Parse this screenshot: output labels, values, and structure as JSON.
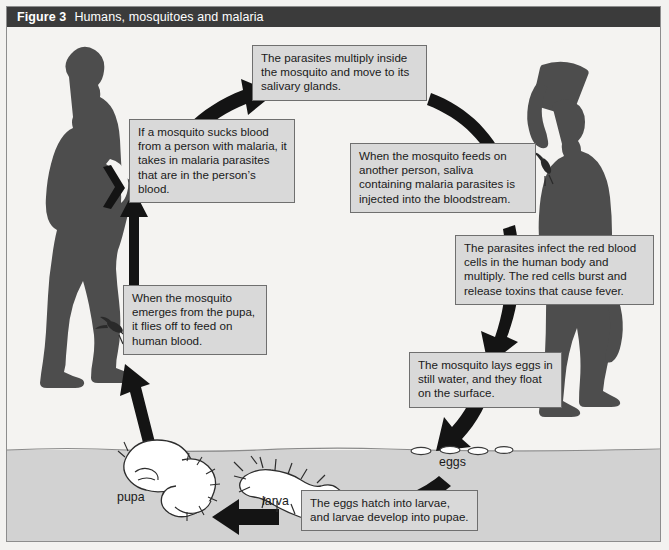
{
  "figure": {
    "number_label": "Figure 3",
    "title": "Humans, mosquitoes and malaria",
    "title_bar_bg": "#3b3b3b",
    "title_bar_fg": "#ffffff",
    "page_bg": "#f4f3f1",
    "silhouette_color": "#4d4d4d",
    "arrow_color": "#141414",
    "textbox_bg": "#d9d9d9",
    "textbox_border": "#6f6f6f",
    "water_fill": "#d2d2d2"
  },
  "callouts": [
    {
      "id": "parasites-multiply",
      "text": "The parasites multiply inside the mosquito and move to its salivary glands."
    },
    {
      "id": "mosquito-sucks-blood",
      "text": "If a mosquito sucks blood from a person with malaria, it takes in malaria parasites that are in the person’s blood."
    },
    {
      "id": "mosquito-feeds-another",
      "text": "When the mosquito feeds on another person, saliva containing malaria parasites is injected into the bloodstream."
    },
    {
      "id": "parasites-infect-red-cells",
      "text": "The parasites infect the red blood cells in the human body and multiply. The red cells burst and release toxins that cause fever."
    },
    {
      "id": "mosquito-lays-eggs",
      "text": "The mosquito lays eggs in still water, and they float on the surface."
    },
    {
      "id": "eggs-hatch",
      "text": "The eggs hatch into larvae, and larvae develop into pupae."
    },
    {
      "id": "mosquito-emerges",
      "text": "When the mosquito emerges from the pupa, it flies off to feed on human blood."
    }
  ],
  "stage_labels": [
    {
      "id": "eggs",
      "text": "eggs"
    },
    {
      "id": "larva",
      "text": "larva"
    },
    {
      "id": "pupa",
      "text": "pupa"
    }
  ],
  "figures": [
    {
      "id": "person-left",
      "description": "human-silhouette-standing-hand-on-hip"
    },
    {
      "id": "person-right",
      "description": "human-silhouette-carrying-load-on-head"
    }
  ],
  "icons": {
    "mosquito_left": "mosquito-icon",
    "mosquito_right": "mosquito-icon",
    "pupa": "pupa-icon",
    "larva": "larva-icon",
    "eggs": "eggs-icon"
  }
}
